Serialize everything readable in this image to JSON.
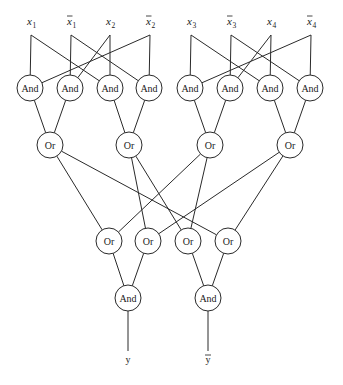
{
  "diagram": {
    "type": "logic-circuit",
    "inputs": [
      {
        "id": "x1",
        "label": "x",
        "sub": "1",
        "negated": false,
        "x": 31,
        "y": 27
      },
      {
        "id": "nx1",
        "label": "x",
        "sub": "1",
        "negated": true,
        "x": 71,
        "y": 27
      },
      {
        "id": "x2",
        "label": "x",
        "sub": "2",
        "negated": false,
        "x": 110,
        "y": 27
      },
      {
        "id": "nx2",
        "label": "x",
        "sub": "2",
        "negated": true,
        "x": 150,
        "y": 27
      },
      {
        "id": "x3",
        "label": "x",
        "sub": "3",
        "negated": false,
        "x": 191,
        "y": 27
      },
      {
        "id": "nx3",
        "label": "x",
        "sub": "3",
        "negated": true,
        "x": 231,
        "y": 27
      },
      {
        "id": "x4",
        "label": "x",
        "sub": "4",
        "negated": false,
        "x": 271,
        "y": 27
      },
      {
        "id": "nx4",
        "label": "x",
        "sub": "4",
        "negated": true,
        "x": 311,
        "y": 27
      }
    ],
    "gates": [
      {
        "id": "and1",
        "label": "And",
        "x": 30,
        "y": 88
      },
      {
        "id": "and2",
        "label": "And",
        "x": 70,
        "y": 88
      },
      {
        "id": "and3",
        "label": "And",
        "x": 110,
        "y": 88
      },
      {
        "id": "and4",
        "label": "And",
        "x": 149,
        "y": 88
      },
      {
        "id": "and5",
        "label": "And",
        "x": 190,
        "y": 88
      },
      {
        "id": "and6",
        "label": "And",
        "x": 230,
        "y": 88
      },
      {
        "id": "and7",
        "label": "And",
        "x": 270,
        "y": 88
      },
      {
        "id": "and8",
        "label": "And",
        "x": 310,
        "y": 88
      },
      {
        "id": "or1",
        "label": "Or",
        "x": 50,
        "y": 145
      },
      {
        "id": "or2",
        "label": "Or",
        "x": 129,
        "y": 145
      },
      {
        "id": "or3",
        "label": "Or",
        "x": 210,
        "y": 145
      },
      {
        "id": "or4",
        "label": "Or",
        "x": 290,
        "y": 145
      },
      {
        "id": "or5",
        "label": "Or",
        "x": 109,
        "y": 241
      },
      {
        "id": "or6",
        "label": "Or",
        "x": 148,
        "y": 241
      },
      {
        "id": "or7",
        "label": "Or",
        "x": 188,
        "y": 241
      },
      {
        "id": "or8",
        "label": "Or",
        "x": 228,
        "y": 241
      },
      {
        "id": "andY",
        "label": "And",
        "x": 128,
        "y": 298
      },
      {
        "id": "andNY",
        "label": "And",
        "x": 208,
        "y": 298
      }
    ],
    "outputs": [
      {
        "id": "y",
        "label": "y",
        "negated": false,
        "x": 128,
        "y": 359
      },
      {
        "id": "ny",
        "label": "y",
        "negated": true,
        "x": 208,
        "y": 359
      }
    ],
    "edges": [
      [
        "x1",
        "and1"
      ],
      [
        "nx2",
        "and1"
      ],
      [
        "nx1",
        "and2"
      ],
      [
        "x2",
        "and2"
      ],
      [
        "x1",
        "and3"
      ],
      [
        "x2",
        "and3"
      ],
      [
        "nx1",
        "and4"
      ],
      [
        "nx2",
        "and4"
      ],
      [
        "x3",
        "and5"
      ],
      [
        "nx4",
        "and5"
      ],
      [
        "nx3",
        "and6"
      ],
      [
        "x4",
        "and6"
      ],
      [
        "x3",
        "and7"
      ],
      [
        "x4",
        "and7"
      ],
      [
        "nx3",
        "and8"
      ],
      [
        "nx4",
        "and8"
      ],
      [
        "and1",
        "or1"
      ],
      [
        "and2",
        "or1"
      ],
      [
        "and3",
        "or2"
      ],
      [
        "and4",
        "or2"
      ],
      [
        "and5",
        "or3"
      ],
      [
        "and6",
        "or3"
      ],
      [
        "and7",
        "or4"
      ],
      [
        "and8",
        "or4"
      ],
      [
        "or1",
        "or5"
      ],
      [
        "or3",
        "or5"
      ],
      [
        "or2",
        "or6"
      ],
      [
        "or4",
        "or6"
      ],
      [
        "or2",
        "or7"
      ],
      [
        "or3",
        "or7"
      ],
      [
        "or1",
        "or8"
      ],
      [
        "or4",
        "or8"
      ],
      [
        "or5",
        "andY"
      ],
      [
        "or6",
        "andY"
      ],
      [
        "or7",
        "andNY"
      ],
      [
        "or8",
        "andNY"
      ],
      [
        "andY",
        "y"
      ],
      [
        "andNY",
        "ny"
      ]
    ],
    "gate_radius": 13,
    "colors": {
      "stroke": "#2a2a2a",
      "fill": "#ffffff",
      "text": "#1a1a1a"
    }
  }
}
